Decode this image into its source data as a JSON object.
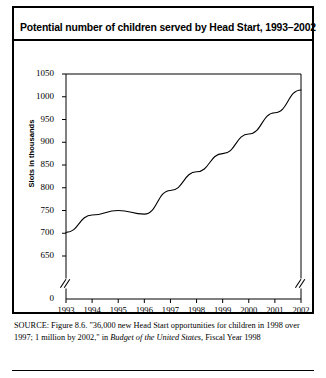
{
  "artifact": {
    "text": ""
  },
  "figure": {
    "title": "Potential number of children served by Head Start, 1993–2002"
  },
  "source": {
    "label": "SOURCE:",
    "part1": " Figure 8.6. \"36,000 new Head Start opportunities for children in 1998 over 1997; 1 million by 2002,\" in ",
    "italic": "Budget of the United States,",
    "part2": " Fiscal Year 1998"
  },
  "chart_data": {
    "type": "line",
    "title": "Potential number of children served by Head Start, 1993–2002",
    "xlabel": "",
    "ylabel": "Slots in thousands",
    "categories": [
      1993,
      1994,
      1995,
      1996,
      1997,
      1998,
      1999,
      2000,
      2001,
      2002
    ],
    "values": [
      702,
      740,
      750,
      742,
      794,
      835,
      875,
      918,
      965,
      1015
    ],
    "series": [
      {
        "name": "Slots in thousands",
        "values": [
          702,
          740,
          750,
          742,
          794,
          835,
          875,
          918,
          965,
          1015
        ]
      }
    ],
    "ylim": [
      650,
      1050
    ],
    "y_ticks": [
      650,
      700,
      750,
      800,
      850,
      900,
      950,
      1000,
      1050
    ],
    "y_tick_labels": [
      "650",
      "700",
      "750",
      "800",
      "850",
      "900",
      "950",
      "1000",
      "1050"
    ],
    "y_zero_label": "0",
    "x_ticks": [
      1993,
      1994,
      1995,
      1996,
      1997,
      1998,
      1999,
      2000,
      2001,
      2002
    ],
    "x_tick_labels": [
      "1993",
      "1994",
      "1995",
      "1996",
      "1997",
      "1998",
      "1999",
      "2000",
      "2001",
      "2002"
    ],
    "axis_break": true,
    "axis_break_glyph": "//",
    "grid": false,
    "legend": "none",
    "line_color": "#000000",
    "frame_color": "#000000",
    "background": "#ffffff"
  }
}
